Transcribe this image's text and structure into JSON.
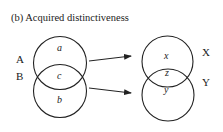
{
  "figure": {
    "title": "(b)  Acquired distinctiveness"
  },
  "left_sets": {
    "labels": {
      "A": "A",
      "B": "B"
    },
    "regions": {
      "a": "a",
      "c": "c",
      "b": "b"
    }
  },
  "right_sets": {
    "labels": {
      "X": "X",
      "Y": "Y"
    },
    "regions": {
      "x": "x",
      "z": "z",
      "y": "y"
    }
  },
  "arrows": [
    {
      "from": "A",
      "to": "X"
    },
    {
      "from": "B",
      "to": "Y"
    }
  ],
  "colors": {
    "stroke": "#222222",
    "background": "#ffffff"
  }
}
